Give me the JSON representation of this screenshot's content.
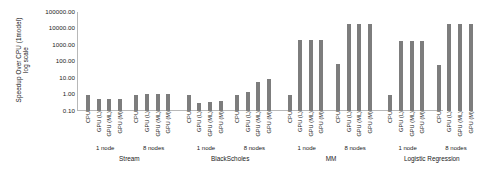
{
  "chart_data": {
    "type": "bar",
    "title": "",
    "ylabel": "Speedup Over CPU (1model) log scale",
    "ylabel_line1": "Speedup Over CPU (1model)",
    "ylabel_line2": "log scale",
    "xlabel": "",
    "log_scale": true,
    "ylim": [
      0.1,
      100000
    ],
    "ytick_labels": [
      "100000.00",
      "10000.00",
      "1000.00",
      "100.00",
      "10.00",
      "1.00",
      "0.10"
    ],
    "ytick_values": [
      100000,
      10000,
      1000,
      100,
      10,
      1,
      0.1
    ],
    "grid": false,
    "legend": "none",
    "bar_color": "#7d7d7d",
    "axis_color": "#b8b8b8",
    "configs": [
      "CPU",
      "GPU (L)",
      "GPU (ML)",
      "GPU (M)"
    ],
    "node_groups": [
      "1 node",
      "8 nodes"
    ],
    "benchmarks": [
      "Stream",
      "BlackScholes",
      "MM",
      "Logistic Regression"
    ],
    "categories": [
      "CPU",
      "GPU (L)",
      "GPU (ML)",
      "GPU (M)",
      "CPU",
      "GPU (L)",
      "GPU (ML)",
      "GPU (M)",
      "CPU",
      "GPU (L)",
      "GPU (ML)",
      "GPU (M)",
      "CPU",
      "GPU (L)",
      "GPU (ML)",
      "GPU (M)",
      "CPU",
      "GPU (L)",
      "GPU (ML)",
      "GPU (M)",
      "CPU",
      "GPU (L)",
      "GPU (ML)",
      "GPU (M)",
      "CPU",
      "GPU (L)",
      "GPU (ML)",
      "GPU (M)",
      "CPU",
      "GPU (L)",
      "GPU (ML)",
      "GPU (M)"
    ],
    "values": [
      1.0,
      0.55,
      0.55,
      0.55,
      1.0,
      1.1,
      1.1,
      1.1,
      1.0,
      0.3,
      0.35,
      0.4,
      1.0,
      1.5,
      6.0,
      9.0,
      1.0,
      2000,
      2000,
      2000,
      70,
      20000,
      20000,
      20000,
      1.0,
      1800,
      1800,
      1800,
      60,
      20000,
      20000,
      20000
    ],
    "groups": [
      {
        "benchmark": "Stream",
        "nodes": [
          {
            "label": "1 node",
            "values": [
              1.0,
              0.55,
              0.55,
              0.55
            ]
          },
          {
            "label": "8 nodes",
            "values": [
              1.0,
              1.1,
              1.1,
              1.1
            ]
          }
        ]
      },
      {
        "benchmark": "BlackScholes",
        "nodes": [
          {
            "label": "1 node",
            "values": [
              1.0,
              0.3,
              0.35,
              0.4
            ]
          },
          {
            "label": "8 nodes",
            "values": [
              1.0,
              1.5,
              6.0,
              9.0
            ]
          }
        ]
      },
      {
        "benchmark": "MM",
        "nodes": [
          {
            "label": "1 node",
            "values": [
              1.0,
              2000,
              2000,
              2000
            ]
          },
          {
            "label": "8 nodes",
            "values": [
              70,
              20000,
              20000,
              20000
            ]
          }
        ]
      },
      {
        "benchmark": "Logistic Regression",
        "nodes": [
          {
            "label": "1 node",
            "values": [
              1.0,
              1800,
              1800,
              1800
            ]
          },
          {
            "label": "8 nodes",
            "values": [
              60,
              20000,
              20000,
              20000
            ]
          }
        ]
      }
    ]
  }
}
